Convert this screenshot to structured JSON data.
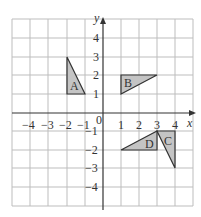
{
  "diagram": {
    "type": "coordinate-grid",
    "axes": {
      "x_label": "x",
      "y_label": "y",
      "origin_label": "0",
      "x_ticks": [
        {
          "value": -4,
          "label": "−4"
        },
        {
          "value": -3,
          "label": "−3"
        },
        {
          "value": -2,
          "label": "−2"
        },
        {
          "value": -1,
          "label": "−1"
        },
        {
          "value": 1,
          "label": "1"
        },
        {
          "value": 2,
          "label": "2"
        },
        {
          "value": 3,
          "label": "3"
        },
        {
          "value": 4,
          "label": "4"
        }
      ],
      "y_ticks": [
        {
          "value": 4,
          "label": "4"
        },
        {
          "value": 3,
          "label": "3"
        },
        {
          "value": 2,
          "label": "2"
        },
        {
          "value": 1,
          "label": "1"
        },
        {
          "value": -1,
          "label": "−1"
        },
        {
          "value": -2,
          "label": "−2"
        },
        {
          "value": -3,
          "label": "−3"
        },
        {
          "value": -4,
          "label": "−4"
        }
      ],
      "x_range": [
        -5,
        5
      ],
      "y_range": [
        -5,
        5
      ]
    },
    "shapes": [
      {
        "label": "A",
        "vertices": [
          [
            -2,
            3
          ],
          [
            -2,
            1
          ],
          [
            -1,
            1
          ]
        ],
        "fill": "#c4c4c4"
      },
      {
        "label": "B",
        "vertices": [
          [
            1,
            2
          ],
          [
            3,
            2
          ],
          [
            1,
            1
          ]
        ],
        "fill": "#c4c4c4"
      },
      {
        "label": "C",
        "vertices": [
          [
            3,
            -1
          ],
          [
            4,
            -1
          ],
          [
            4,
            -3
          ]
        ],
        "fill": "#c4c4c4"
      },
      {
        "label": "D",
        "vertices": [
          [
            3,
            -1
          ],
          [
            3,
            -2
          ],
          [
            1,
            -2
          ]
        ],
        "fill": "#c4c4c4"
      }
    ],
    "colors": {
      "grid": "#bdbdbd",
      "axis": "#333333",
      "shape_stroke": "#333333"
    }
  }
}
